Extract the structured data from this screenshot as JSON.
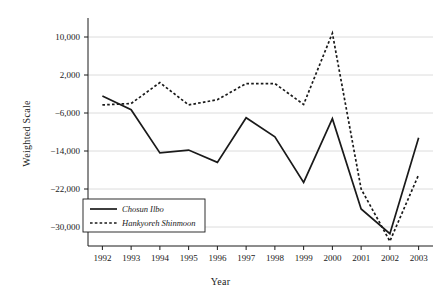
{
  "chart_data": {
    "type": "line",
    "title": "",
    "xlabel": "Year",
    "ylabel": "Weighted Scale",
    "categories": [
      "1992",
      "1993",
      "1994",
      "1995",
      "1996",
      "1997",
      "1998",
      "1999",
      "2000",
      "2001",
      "2002",
      "2003"
    ],
    "x": [
      1992,
      1993,
      1994,
      1995,
      1996,
      1997,
      1998,
      1999,
      2000,
      2001,
      2002,
      2003
    ],
    "xlim": [
      1991.5,
      2003.5
    ],
    "ylim": [
      -34000,
      14000
    ],
    "yticks": [
      10000,
      2000,
      -6000,
      -14000,
      -22000,
      -30000
    ],
    "ytick_labels": [
      "10,000",
      "2,000",
      "−6,000",
      "−14,000",
      "−22,000",
      "−30,000"
    ],
    "grid": "horizontal",
    "legend_position": "lower-left",
    "series": [
      {
        "name": "Chosun Ilbo",
        "style": "solid",
        "color": "#1a1a1a",
        "values": [
          -2400,
          -5300,
          -14400,
          -13800,
          -16400,
          -7000,
          -11000,
          -20600,
          -7200,
          -26200,
          -31400,
          -11200
        ]
      },
      {
        "name": "Hankyoreh Shinmoon",
        "style": "dotted",
        "color": "#1a1a1a",
        "values": [
          -4300,
          -4000,
          400,
          -4300,
          -3200,
          200,
          200,
          -4200,
          10800,
          -22000,
          -33000,
          -19000
        ]
      }
    ],
    "legend": [
      {
        "label": "Chosun Ilbo",
        "style": "solid"
      },
      {
        "label": "Hankyoreh Shinmoon",
        "style": "dotted"
      }
    ]
  },
  "axes": {
    "y_title": "Weighted Scale",
    "x_title": "Year"
  }
}
